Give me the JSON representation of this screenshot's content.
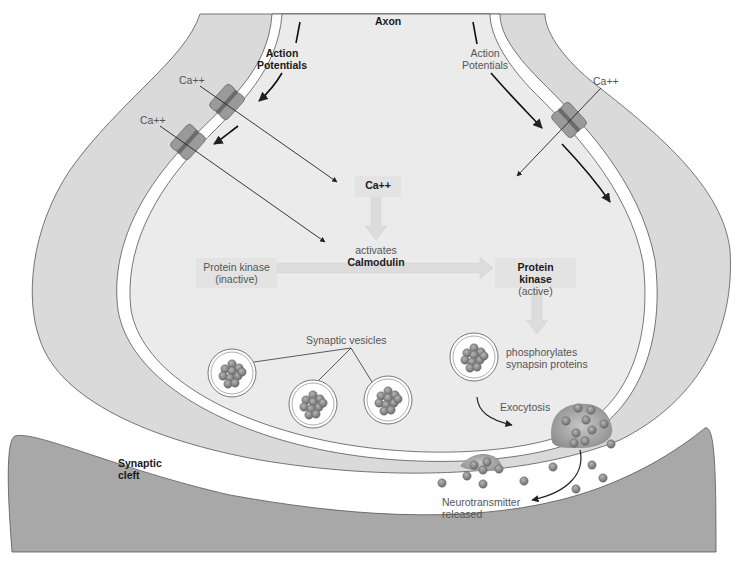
{
  "diagram": {
    "labels": {
      "axon": "Axon",
      "action_potentials_left_1": "Action",
      "action_potentials_left_2": "Potentials",
      "action_potentials_right_1": "Action",
      "action_potentials_right_2": "Potentials",
      "ca_left_top": "Ca++",
      "ca_left_bottom": "Ca++",
      "ca_right": "Ca++",
      "ca_box": "Ca++",
      "activates": "activates",
      "calmodulin": "Calmodulin",
      "pk_inactive_1": "Protein kinase",
      "pk_inactive_2": "(inactive)",
      "pk_active_1": "Protein kinase",
      "pk_active_2": "(active)",
      "synaptic_vesicles": "Synaptic vesicles",
      "phosphorylates_1": "phosphorylates",
      "phosphorylates_2": "synapsin proteins",
      "exocytosis": "Exocytosis",
      "synaptic_cleft_1": "Synaptic",
      "synaptic_cleft_2": "cleft",
      "neurotransmitter_1": "Neurotransmitter",
      "neurotransmitter_2": "released"
    },
    "colors": {
      "cytoplasm": "#ebebeb",
      "membrane_outer": "#d9d9d9",
      "postsynaptic": "#a6a6a6",
      "vesicle_dot": "#8a8a8a",
      "channel": "#8f8f8f",
      "box_fill": "#e3e3e3"
    }
  }
}
